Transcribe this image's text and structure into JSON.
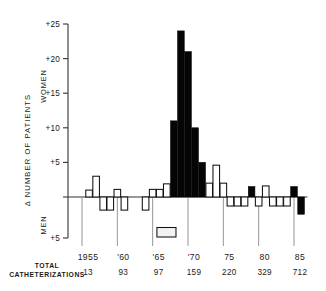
{
  "chart_data": {
    "type": "bar",
    "title": "",
    "subtitle": "",
    "xlabel": "",
    "ylabel": "Δ NUMBER OF PATIENTS",
    "ylim": [
      -5,
      25
    ],
    "xlim": [
      1954.5,
      1986.5
    ],
    "grid": false,
    "legend_position": "none",
    "y_ticks": [
      25,
      20,
      15,
      10,
      5,
      0,
      -5
    ],
    "y_tick_labels": [
      "+25",
      "+20",
      "+15",
      "+10",
      "+5",
      "",
      "+5"
    ],
    "x_ticks": [
      1955,
      1960,
      1965,
      1970,
      1975,
      1980,
      1985
    ],
    "x_tick_labels": [
      "1955",
      "'60",
      "'65",
      "'70",
      "75",
      "80",
      "85"
    ],
    "upper_region_label": "WOMEN",
    "lower_region_label": "MEN",
    "series_note": "Positive values denote excess women; negative values denote excess men.",
    "categories": [
      1955,
      1956,
      1957,
      1958,
      1959,
      1960,
      1961,
      1962,
      1963,
      1964,
      1965,
      1966,
      1967,
      1968,
      1969,
      1970,
      1971,
      1972,
      1973,
      1974,
      1975,
      1976,
      1977,
      1978,
      1979,
      1980,
      1981,
      1982,
      1983,
      1984,
      1985,
      1986
    ],
    "values": [
      1,
      1,
      3,
      -1,
      -1,
      1,
      0,
      0,
      -1,
      0,
      1,
      1,
      -1,
      24,
      -4,
      11,
      -4,
      5,
      -5,
      3,
      5,
      -1,
      1,
      -1,
      0,
      1,
      0,
      2,
      -1,
      -1,
      2,
      -2
    ],
    "bar_styles": [
      "open",
      "open",
      "open",
      "open",
      "open",
      "open",
      "open",
      "open",
      "open",
      "open",
      "open",
      "open",
      "open",
      "filled",
      "filled",
      "filled",
      "filled",
      "filled",
      "filled",
      "filled",
      "open",
      "open",
      "open",
      "open",
      "open",
      "filled",
      "open",
      "open",
      "open",
      "open",
      "filled",
      "filled"
    ],
    "peak_profile": [
      {
        "year": 1966,
        "value": 2,
        "style": "open"
      },
      {
        "year": 1967,
        "value": 11,
        "style": "filled"
      },
      {
        "year": 1968,
        "value": 24,
        "style": "filled"
      },
      {
        "year": 1969,
        "value": 21,
        "style": "filled"
      },
      {
        "year": 1970,
        "value": 10,
        "style": "filled"
      },
      {
        "year": 1971,
        "value": 2,
        "style": "filled"
      },
      {
        "year": 1972,
        "value": 5,
        "style": "filled"
      }
    ],
    "annotation_box": {
      "label": "",
      "x_start": 1965.6,
      "x_end": 1968.3,
      "y": -4.3
    },
    "totals_row_label": "TOTAL CATHETERIZATIONS",
    "totals_years": [
      1955,
      1960,
      1965,
      1970,
      1975,
      1980,
      1985
    ],
    "totals_values": [
      "13",
      "93",
      "97",
      "159",
      "220",
      "329",
      "712"
    ],
    "bars": [
      {
        "year": 1955.0,
        "value": 0.0,
        "style": "open"
      },
      {
        "year": 1956.0,
        "value": 1.0,
        "style": "open"
      },
      {
        "year": 1957.0,
        "value": 3.0,
        "style": "open"
      },
      {
        "year": 1958.0,
        "value": -1.6,
        "style": "open"
      },
      {
        "year": 1959.0,
        "value": -1.6,
        "style": "open"
      },
      {
        "year": 1960.0,
        "value": 1.1,
        "style": "open"
      },
      {
        "year": 1961.0,
        "value": -1.6,
        "style": "open"
      },
      {
        "year": 1962.0,
        "value": 0.0,
        "style": "open"
      },
      {
        "year": 1963.0,
        "value": 0.0,
        "style": "open"
      },
      {
        "year": 1964.0,
        "value": -1.6,
        "style": "open"
      },
      {
        "year": 1965.0,
        "value": 1.1,
        "style": "open"
      },
      {
        "year": 1966.0,
        "value": 1.1,
        "style": "open"
      },
      {
        "year": 1967.0,
        "value": 1.9,
        "style": "open"
      },
      {
        "year": 1968.0,
        "value": 11.0,
        "style": "filled"
      },
      {
        "year": 1969.0,
        "value": 24.0,
        "style": "filled"
      },
      {
        "year": 1970.0,
        "value": 21.0,
        "style": "filled"
      },
      {
        "year": 1971.0,
        "value": 10.0,
        "style": "filled"
      },
      {
        "year": 1972.0,
        "value": 5.0,
        "style": "filled"
      },
      {
        "year": 1973.0,
        "value": 2.0,
        "style": "open"
      },
      {
        "year": 1974.0,
        "value": 4.6,
        "style": "open"
      },
      {
        "year": 1975.0,
        "value": 2.0,
        "style": "open"
      },
      {
        "year": 1976.0,
        "value": -1.1,
        "style": "open"
      },
      {
        "year": 1977.0,
        "value": -1.1,
        "style": "open"
      },
      {
        "year": 1978.0,
        "value": -1.1,
        "style": "open"
      },
      {
        "year": 1979.0,
        "value": 1.5,
        "style": "filled"
      },
      {
        "year": 1980.0,
        "value": -1.1,
        "style": "open"
      },
      {
        "year": 1981.0,
        "value": 1.6,
        "style": "open"
      },
      {
        "year": 1982.0,
        "value": -1.1,
        "style": "open"
      },
      {
        "year": 1983.0,
        "value": -1.1,
        "style": "open"
      },
      {
        "year": 1984.0,
        "value": -1.1,
        "style": "open"
      },
      {
        "year": 1985.0,
        "value": 1.5,
        "style": "filled"
      },
      {
        "year": 1986.0,
        "value": -2.1,
        "style": "filled"
      }
    ]
  }
}
